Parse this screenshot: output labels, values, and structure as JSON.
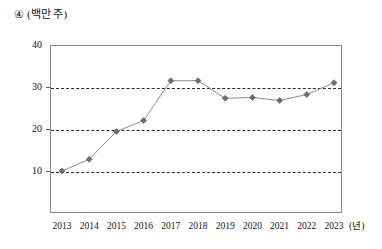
{
  "caption": {
    "number": "④",
    "unit": "(백만 주)"
  },
  "chart_data": {
    "type": "line",
    "title": "",
    "subtitle": "",
    "xlabel": "(년)",
    "ylabel": "(백만 주)",
    "categories": [
      "2013",
      "2014",
      "2015",
      "2016",
      "2017",
      "2018",
      "2019",
      "2020",
      "2021",
      "2022",
      "2023"
    ],
    "values": [
      10.0,
      12.8,
      19.4,
      22.0,
      31.5,
      31.5,
      27.3,
      27.5,
      26.8,
      28.2,
      31.0
    ],
    "series": [
      {
        "name": "거래량",
        "values": [
          10.0,
          12.8,
          19.4,
          22.0,
          31.5,
          31.5,
          27.3,
          27.5,
          26.8,
          28.2,
          31.0
        ]
      }
    ],
    "ylim": [
      0,
      40
    ],
    "yticks": [
      10,
      20,
      30,
      40
    ],
    "ytick_labels": [
      "10",
      "20",
      "30",
      "40"
    ],
    "xlim": [
      "2013",
      "2023"
    ],
    "grid": true,
    "gridlines_at": [
      10,
      20,
      30
    ],
    "legend": "none",
    "marker": "diamond",
    "line_color": "#8c8c8c",
    "marker_color": "#6e6e6e",
    "grid_color": "#2a2a2a",
    "frame_color": "#8a8a8a"
  }
}
